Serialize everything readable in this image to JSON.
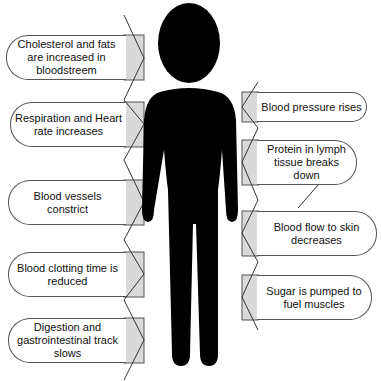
{
  "diagram": {
    "type": "stress-response-body-effects",
    "figure": {
      "icon": "human-silhouette-icon",
      "color": "#000000"
    },
    "colors": {
      "box_border": "#555555",
      "box_fill": "#ffffff",
      "arrow_shade": "#d9d9d9",
      "text": "#111111"
    },
    "left_effects": [
      {
        "label": "Cholesterol and fats are increased in bloodstreem"
      },
      {
        "label": "Respiration and Heart rate increases"
      },
      {
        "label": "Blood vessels constrict"
      },
      {
        "label": "Blood clotting time is reduced"
      },
      {
        "label": "Digestion and gastrointestinal track slows"
      }
    ],
    "right_effects": [
      {
        "label": "Blood pressure rises"
      },
      {
        "label": "Protein in lymph tissue breaks down"
      },
      {
        "label": "Blood flow to skin decreases"
      },
      {
        "label": "Sugar is pumped to fuel muscles"
      }
    ]
  }
}
